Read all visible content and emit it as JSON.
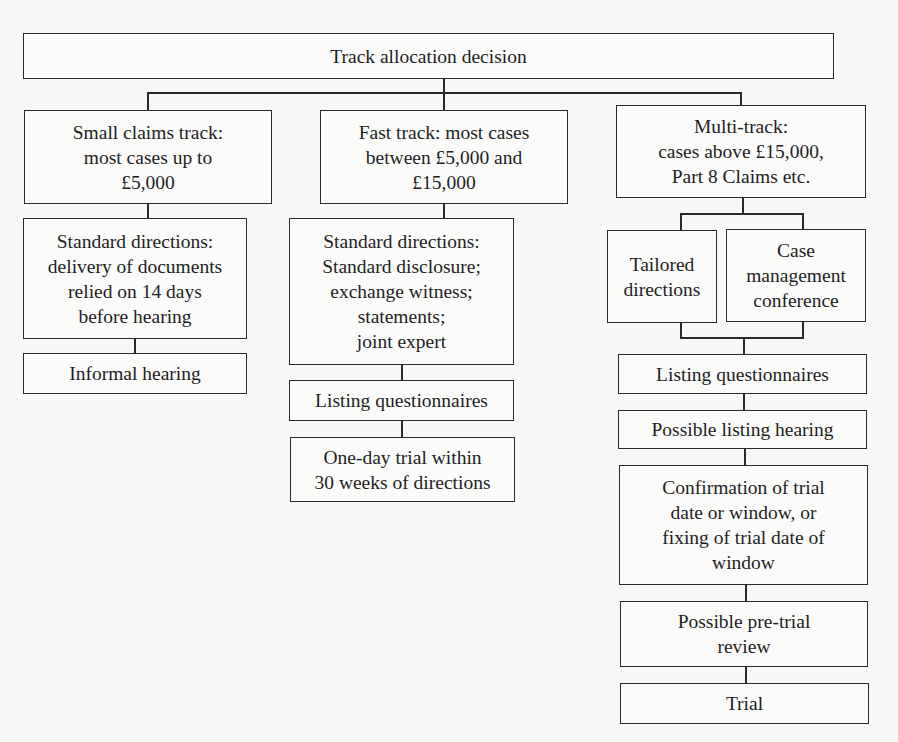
{
  "diagram": {
    "title": "Track allocation decision",
    "tracks": [
      {
        "id": "small-claims",
        "heading": "Small claims track:\nmost cases up to\n£5,000",
        "steps": [
          "Standard directions:\ndelivery of documents\nrelied on 14 days\nbefore hearing",
          "Informal hearing"
        ]
      },
      {
        "id": "fast-track",
        "heading": "Fast track: most cases\nbetween £5,000 and\n£15,000",
        "steps": [
          "Standard directions:\nStandard disclosure;\nexchange witness;\nstatements;\njoint expert",
          "Listing questionnaires",
          "One-day trial within\n30 weeks of directions"
        ]
      },
      {
        "id": "multi-track",
        "heading": "Multi-track:\ncases above £15,000,\nPart 8 Claims etc.",
        "branches": [
          "Tailored\ndirections",
          "Case\nmanagement\nconference"
        ],
        "steps": [
          "Listing questionnaires",
          "Possible listing hearing",
          "Confirmation of trial\ndate or window, or\nfixing of trial date of\nwindow",
          "Possible pre-trial\nreview",
          "Trial"
        ]
      }
    ]
  }
}
